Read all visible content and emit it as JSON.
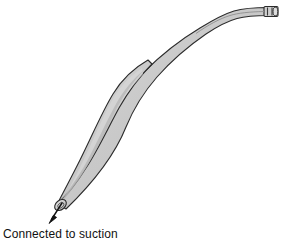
{
  "figure": {
    "name": "suction-tube-diagram",
    "type": "medical-device-line-drawing",
    "background_color": "#ffffff",
    "device": {
      "label": "suction tube",
      "body_fill_color": "#c9c9c9",
      "body_fill_color_light": "#d6d6d6",
      "body_fill_color_shadow": "#b4b4b4",
      "outline_color": "#2b2b2b",
      "outline_width": 1,
      "parts": [
        {
          "name": "distal-tip-opening",
          "label": "open tip",
          "position": "lower-left"
        },
        {
          "name": "tapered-shaft",
          "label": "tapered shaft",
          "position": "lower-left-to-center"
        },
        {
          "name": "flattened-bulge",
          "label": "flattened widened segment",
          "position": "center"
        },
        {
          "name": "narrow-tube",
          "label": "narrow tube",
          "position": "upper-right"
        },
        {
          "name": "proximal-end-cap",
          "label": "connector end",
          "position": "top-right"
        }
      ]
    },
    "annotation": {
      "text": "Connected to suction",
      "arrow": {
        "name": "suction-arrow",
        "from_x": 62,
        "from_y": 203,
        "to_x": 50,
        "to_y": 221,
        "color": "#111111"
      },
      "text_color": "#111111",
      "font_size_px": 12
    }
  }
}
